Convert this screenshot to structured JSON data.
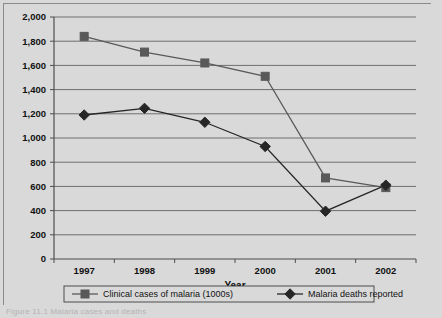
{
  "figure": {
    "caption": "Figure 11.1  Malaria cases and deaths"
  },
  "chart_data": {
    "type": "line",
    "title": "",
    "xlabel": "Year",
    "ylabel": "",
    "categories": [
      "1997",
      "1998",
      "1999",
      "2000",
      "2001",
      "2002"
    ],
    "ylim": [
      0,
      2000
    ],
    "ytick_labels": [
      "0",
      "200",
      "400",
      "600",
      "800",
      "1,000",
      "1,200",
      "1,400",
      "1,600",
      "1,800",
      "2,000"
    ],
    "ytick_values": [
      0,
      200,
      400,
      600,
      800,
      1000,
      1200,
      1400,
      1600,
      1800,
      2000
    ],
    "grid": true,
    "legend_position": "bottom",
    "series": [
      {
        "name": "Clinical cases of malaria (1000s)",
        "marker": "square",
        "color": "#595959",
        "values": [
          1840,
          1710,
          1620,
          1510,
          670,
          590
        ]
      },
      {
        "name": "Malaria deaths reported",
        "marker": "diamond",
        "color": "#262626",
        "values": [
          1190,
          1245,
          1130,
          930,
          395,
          610
        ]
      }
    ]
  },
  "colors": {
    "background": "#d9d9d9",
    "plot_background": "#d9d9d9",
    "axis": "#4d4d4d",
    "grid": "#6e6e6e",
    "series_1": "#595959",
    "series_2": "#262626"
  }
}
